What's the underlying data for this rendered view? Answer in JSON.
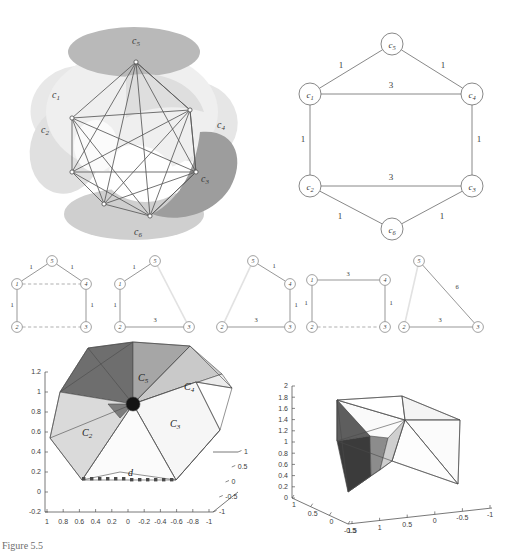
{
  "figure": {
    "caption_fragment": "Figure 5.5",
    "panels": [
      "sphere-partition",
      "weighted-hexagon-graph",
      "subgraph-row",
      "polyhedron-left",
      "polyhedron-right"
    ]
  },
  "sphere_panel": {
    "name": "spherical-partition",
    "region_labels": [
      "c_1",
      "c_2",
      "c_3",
      "c_4",
      "c_5",
      "c_6"
    ],
    "labels": [
      {
        "text": "c",
        "sub": "5",
        "x": 137,
        "y": 44
      },
      {
        "text": "c",
        "sub": "1",
        "x": 57,
        "y": 98
      },
      {
        "text": "c",
        "sub": "2",
        "x": 46,
        "y": 133
      },
      {
        "text": "c",
        "sub": "4",
        "x": 222,
        "y": 128
      },
      {
        "text": "c",
        "sub": "3",
        "x": 207,
        "y": 182
      },
      {
        "text": "c",
        "sub": "6",
        "x": 139,
        "y": 231
      }
    ],
    "colors": {
      "light": "#e3e3e3",
      "mid": "#cccccc",
      "dark": "#9a9a9a",
      "edge": "#5a5a5a"
    }
  },
  "hexagon_graph": {
    "name": "weighted-hexagon-graph",
    "nodes": [
      {
        "id": "c5",
        "label": "c",
        "sub": "5",
        "x": 392,
        "y": 44
      },
      {
        "id": "c1",
        "label": "c",
        "sub": "1",
        "x": 310,
        "y": 94
      },
      {
        "id": "c4",
        "label": "c",
        "sub": "4",
        "x": 472,
        "y": 94
      },
      {
        "id": "c2",
        "label": "c",
        "sub": "2",
        "x": 310,
        "y": 186
      },
      {
        "id": "c3",
        "label": "c",
        "sub": "3",
        "x": 472,
        "y": 186
      },
      {
        "id": "c6",
        "label": "c",
        "sub": "6",
        "x": 392,
        "y": 229
      }
    ],
    "edges": [
      {
        "from": "c1",
        "to": "c5",
        "weight": "1",
        "lx": 341,
        "ly": 68
      },
      {
        "from": "c5",
        "to": "c4",
        "weight": "1",
        "lx": 443,
        "ly": 68
      },
      {
        "from": "c1",
        "to": "c4",
        "weight": "3",
        "lx": 391,
        "ly": 88
      },
      {
        "from": "c1",
        "to": "c2",
        "weight": "1",
        "lx": 303,
        "ly": 142
      },
      {
        "from": "c4",
        "to": "c3",
        "weight": "1",
        "lx": 479,
        "ly": 142
      },
      {
        "from": "c2",
        "to": "c3",
        "weight": "3",
        "lx": 391,
        "ly": 180
      },
      {
        "from": "c2",
        "to": "c6",
        "weight": "1",
        "lx": 340,
        "ly": 219
      },
      {
        "from": "c6",
        "to": "c3",
        "weight": "1",
        "lx": 442,
        "ly": 219
      }
    ]
  },
  "subgraph_row": {
    "name": "subgraph-row",
    "graphs": [
      {
        "id": "sub1",
        "nodes": [
          {
            "id": "5",
            "label": "5",
            "x": 52,
            "y": 261
          },
          {
            "id": "1",
            "label": "1",
            "x": 17,
            "y": 284
          },
          {
            "id": "4",
            "label": "4",
            "x": 86,
            "y": 284
          },
          {
            "id": "2",
            "label": "2",
            "x": 17,
            "y": 327
          },
          {
            "id": "3",
            "label": "3",
            "x": 86,
            "y": 327
          }
        ],
        "edges": [
          {
            "from": "1",
            "to": "5",
            "weight": "1",
            "style": "solid",
            "lx": 31,
            "ly": 269
          },
          {
            "from": "5",
            "to": "4",
            "weight": "1",
            "style": "solid",
            "lx": 72,
            "ly": 269
          },
          {
            "from": "1",
            "to": "4",
            "weight": "",
            "style": "dashed",
            "lx": 0,
            "ly": 0
          },
          {
            "from": "1",
            "to": "2",
            "weight": "1",
            "style": "solid",
            "lx": 12,
            "ly": 307
          },
          {
            "from": "4",
            "to": "3",
            "weight": "1",
            "style": "solid",
            "lx": 92,
            "ly": 307
          },
          {
            "from": "2",
            "to": "3",
            "weight": "",
            "style": "dashed",
            "lx": 0,
            "ly": 0
          }
        ]
      },
      {
        "id": "sub2",
        "nodes": [
          {
            "id": "5",
            "label": "5",
            "x": 155,
            "y": 261
          },
          {
            "id": "1",
            "label": "1",
            "x": 120,
            "y": 284
          },
          {
            "id": "2",
            "label": "2",
            "x": 120,
            "y": 327
          },
          {
            "id": "3",
            "label": "3",
            "x": 189,
            "y": 327
          }
        ],
        "edges": [
          {
            "from": "1",
            "to": "5",
            "weight": "1",
            "style": "solid",
            "lx": 134,
            "ly": 269
          },
          {
            "from": "5",
            "to": "3",
            "weight": "",
            "style": "faint",
            "lx": 0,
            "ly": 0
          },
          {
            "from": "1",
            "to": "2",
            "weight": "1",
            "style": "solid",
            "lx": 115,
            "ly": 307
          },
          {
            "from": "2",
            "to": "3",
            "weight": "3",
            "style": "solid",
            "lx": 155,
            "ly": 322
          }
        ]
      },
      {
        "id": "sub3",
        "nodes": [
          {
            "id": "5",
            "label": "5",
            "x": 253,
            "y": 261
          },
          {
            "id": "4",
            "label": "4",
            "x": 290,
            "y": 284
          },
          {
            "id": "2",
            "label": "2",
            "x": 222,
            "y": 327
          },
          {
            "id": "3",
            "label": "3",
            "x": 290,
            "y": 327
          }
        ],
        "edges": [
          {
            "from": "5",
            "to": "4",
            "weight": "1",
            "style": "solid",
            "lx": 274,
            "ly": 268
          },
          {
            "from": "5",
            "to": "2",
            "weight": "",
            "style": "faint",
            "lx": 0,
            "ly": 0
          },
          {
            "from": "4",
            "to": "3",
            "weight": "1",
            "style": "solid",
            "lx": 296,
            "ly": 307
          },
          {
            "from": "2",
            "to": "3",
            "weight": "3",
            "style": "solid",
            "lx": 256,
            "ly": 322
          }
        ]
      },
      {
        "id": "sub4",
        "nodes": [
          {
            "id": "1",
            "label": "1",
            "x": 312,
            "y": 280
          },
          {
            "id": "4",
            "label": "4",
            "x": 385,
            "y": 280
          },
          {
            "id": "2",
            "label": "2",
            "x": 312,
            "y": 327
          },
          {
            "id": "3",
            "label": "3",
            "x": 385,
            "y": 327
          }
        ],
        "edges": [
          {
            "from": "1",
            "to": "4",
            "weight": "3",
            "style": "solid",
            "lx": 348,
            "ly": 276
          },
          {
            "from": "1",
            "to": "2",
            "weight": "1",
            "style": "solid",
            "lx": 306,
            "ly": 305
          },
          {
            "from": "4",
            "to": "3",
            "weight": "1",
            "style": "solid",
            "lx": 391,
            "ly": 305
          },
          {
            "from": "2",
            "to": "3",
            "weight": "",
            "style": "dashed",
            "lx": 0,
            "ly": 0
          }
        ]
      },
      {
        "id": "sub5",
        "nodes": [
          {
            "id": "5",
            "label": "5",
            "x": 419,
            "y": 261
          },
          {
            "id": "2",
            "label": "2",
            "x": 404,
            "y": 327
          },
          {
            "id": "3",
            "label": "3",
            "x": 478,
            "y": 327
          }
        ],
        "edges": [
          {
            "from": "5",
            "to": "3",
            "weight": "6",
            "style": "solid",
            "lx": 457,
            "ly": 289
          },
          {
            "from": "5",
            "to": "2",
            "weight": "",
            "style": "faint",
            "lx": 0,
            "ly": 0
          },
          {
            "from": "2",
            "to": "3",
            "weight": "3",
            "style": "solid",
            "lx": 440,
            "ly": 322
          }
        ]
      }
    ]
  },
  "plot_left": {
    "name": "polyhedron-plot-left",
    "face_labels": [
      {
        "text": "C",
        "sub": "5",
        "x": 143,
        "y": 378
      },
      {
        "text": "C",
        "sub": "4",
        "x": 189,
        "y": 387
      },
      {
        "text": "C",
        "sub": "2",
        "x": 87,
        "y": 433
      },
      {
        "text": "C",
        "sub": "3",
        "x": 175,
        "y": 424
      }
    ],
    "annotation": "d",
    "y_ticks": [
      "1.2",
      "1",
      "0.8",
      "0.6",
      "0.4",
      "0.2",
      "0",
      "-0.2"
    ],
    "x_ticks": [
      "1",
      "0.8",
      "0.6",
      "0.4",
      "0.2",
      "0",
      "-0.2",
      "-0.4",
      "-0.6",
      "-0.8",
      "-1"
    ],
    "z_ticks": [
      "1",
      "0.5",
      "0",
      "-0.5",
      "-1"
    ],
    "ylim": [
      -0.2,
      1.2
    ],
    "xlim": [
      1,
      -1
    ],
    "zlim": [
      -1,
      1
    ]
  },
  "plot_right": {
    "name": "polyhedron-plot-right",
    "y_ticks": [
      "2",
      "1.8",
      "1.6",
      "1.4",
      "1.2",
      "1",
      "0.8",
      "0.6",
      "0.4",
      "0.2",
      "0"
    ],
    "x_ticks": [
      "1",
      "0.5",
      "0",
      "-0.5"
    ],
    "z_ticks": [
      "1.5",
      "1",
      "0.5",
      "0",
      "-0.5",
      "-1"
    ],
    "ylim": [
      0,
      2
    ],
    "xlim": [
      1,
      -0.5
    ],
    "zlim": [
      1.5,
      -1
    ]
  },
  "chart_data": {
    "type": "diagram",
    "graph_nodes": [
      "c1",
      "c2",
      "c3",
      "c4",
      "c5",
      "c6"
    ],
    "graph_edges": [
      {
        "u": "c1",
        "v": "c5",
        "w": 1
      },
      {
        "u": "c5",
        "v": "c4",
        "w": 1
      },
      {
        "u": "c1",
        "v": "c4",
        "w": 3
      },
      {
        "u": "c1",
        "v": "c2",
        "w": 1
      },
      {
        "u": "c4",
        "v": "c3",
        "w": 1
      },
      {
        "u": "c2",
        "v": "c3",
        "w": 3
      },
      {
        "u": "c2",
        "v": "c6",
        "w": 1
      },
      {
        "u": "c6",
        "v": "c3",
        "w": 1
      }
    ],
    "subgraph_weight_sets": [
      [
        1,
        1,
        1,
        1
      ],
      [
        1,
        1,
        3
      ],
      [
        1,
        1,
        3
      ],
      [
        3,
        1,
        1
      ],
      [
        6,
        3
      ]
    ]
  }
}
